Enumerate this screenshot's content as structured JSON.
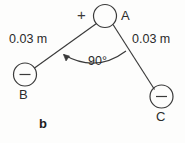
{
  "figure": {
    "part_label": "b",
    "charges": [
      {
        "id": "A",
        "label": "A",
        "sign": "+",
        "sign_inside": false,
        "cx": 105,
        "cy": 16,
        "r": 11.5
      },
      {
        "id": "B",
        "label": "B",
        "sign": "−",
        "sign_inside": true,
        "cx": 25,
        "cy": 74.5,
        "r": 11.5
      },
      {
        "id": "C",
        "label": "C",
        "sign": "−",
        "sign_inside": true,
        "cx": 161.5,
        "cy": 96.5,
        "r": 11.5
      }
    ],
    "distances": [
      {
        "from": "A",
        "to": "B",
        "text": "0.03 m"
      },
      {
        "from": "A",
        "to": "C",
        "text": "0.03 m"
      }
    ],
    "angle": {
      "at": "A",
      "between": [
        "B",
        "C"
      ],
      "text": "90°",
      "value": 90,
      "unit": "degrees"
    },
    "colors": {
      "stroke": "#3a3a3a",
      "text": "#2b2b2b",
      "background": "#fdfdfc"
    }
  }
}
